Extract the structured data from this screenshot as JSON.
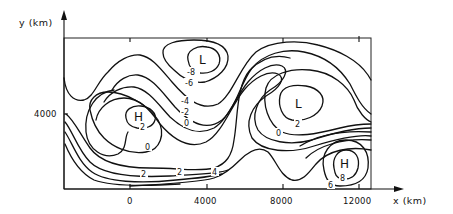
{
  "figure": {
    "type": "contour_map",
    "x_axis": {
      "label": "x (km)",
      "ticks": [
        "0",
        "4000",
        "8000",
        "12000"
      ]
    },
    "y_axis": {
      "label": "y (km)",
      "ticks": [
        "4000"
      ]
    },
    "centers": [
      {
        "symbol": "L",
        "label": "L",
        "x_km": 3000,
        "y_km": 7200
      },
      {
        "symbol": "H",
        "label": "H",
        "x_km": 400,
        "y_km": 3800
      },
      {
        "symbol": "L",
        "label": "L",
        "x_km": 8600,
        "y_km": 4200
      },
      {
        "symbol": "H",
        "label": "H",
        "x_km": 11300,
        "y_km": 1300
      }
    ],
    "contour_labels": [
      "-8",
      "-6",
      "-4",
      "-2",
      "0",
      "2",
      "2",
      "0",
      "2",
      "4",
      "2",
      "0",
      "8",
      "6"
    ],
    "contours": {
      "low_north_inner": "-8",
      "low_north_outer": "-6",
      "trough_a": "-4",
      "trough_b": "-2",
      "trough_c": "0",
      "high_west_inner": "2",
      "west_zero": "0",
      "west_two": "2",
      "west_four": "4",
      "low_east_inner": "2",
      "low_east_zero": "0",
      "high_east_inner": "8",
      "high_east_outer": "6"
    }
  }
}
